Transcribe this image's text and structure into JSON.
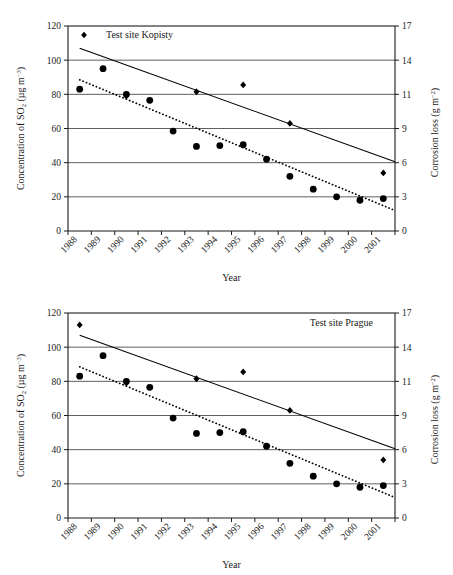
{
  "figures": [
    {
      "id": "kopisty",
      "label": "Test site Kopisty",
      "label_position": "top-left",
      "label_marker": "diamond",
      "chart_data": {
        "type": "scatter",
        "title": "Test site Kopisty",
        "xlabel": "Year",
        "ylabel": "Concentration of SO2 (µg m-3)",
        "y2label": "Corrosion loss (g m-2)",
        "categories": [
          "1988",
          "1989",
          "1990",
          "1991",
          "1992",
          "1993",
          "1994",
          "1995",
          "1996",
          "1997",
          "1998",
          "1999",
          "2000",
          "2001"
        ],
        "ylim": [
          0,
          120
        ],
        "yticks": [
          0,
          20,
          40,
          60,
          80,
          100,
          120
        ],
        "y2lim": [
          0,
          17
        ],
        "y2ticks": [
          0,
          3,
          6,
          9,
          11,
          14,
          17
        ],
        "grid": "horizontal",
        "legend": "inside-top-left",
        "series": [
          {
            "name": "Concentration of SO2",
            "marker": "circle",
            "axis": "left",
            "values": [
              83,
              95,
              80,
              76.5,
              58.5,
              49.5,
              50,
              50.5,
              42,
              32,
              24.5,
              20,
              18,
              19
            ]
          },
          {
            "name": "Corrosion loss",
            "marker": "diamond",
            "axis": "left",
            "values": [
              null,
              null,
              79,
              null,
              null,
              81.5,
              null,
              85.5,
              null,
              63,
              null,
              null,
              null,
              34
            ]
          }
        ],
        "trendlines": [
          {
            "name": "Corrosion loss trend",
            "style": "solid",
            "x_start": "1988",
            "x_end": "2001",
            "y_start": 107,
            "y_end": 40.5
          },
          {
            "name": "SO2 concentration trend",
            "style": "dotted",
            "x_start": "1988",
            "x_end": "2001",
            "y_start": 88.5,
            "y_end": 12
          }
        ]
      }
    },
    {
      "id": "prague",
      "label": "Test site Prague",
      "label_position": "top-right",
      "label_marker": "none",
      "chart_data": {
        "type": "scatter",
        "title": "Test site Prague",
        "xlabel": "Year",
        "ylabel": "Concentration of SO2 (µg m-3)",
        "y2label": "Corrosion loss (g m-2)",
        "categories": [
          "1988",
          "1989",
          "1990",
          "1991",
          "1992",
          "1993",
          "1994",
          "1995",
          "1996",
          "1997",
          "1998",
          "1999",
          "2000",
          "2001"
        ],
        "ylim": [
          0,
          120
        ],
        "yticks": [
          0,
          20,
          40,
          60,
          80,
          100,
          120
        ],
        "y2lim": [
          0,
          17
        ],
        "y2ticks": [
          0,
          3,
          6,
          9,
          11,
          14,
          17
        ],
        "grid": "horizontal",
        "legend": "inside-top-right",
        "series": [
          {
            "name": "Concentration of SO2",
            "marker": "circle",
            "axis": "left",
            "values": [
              83,
              95,
              80,
              76.5,
              58.5,
              49.5,
              50,
              50.5,
              42,
              32,
              24.5,
              20,
              18,
              19
            ]
          },
          {
            "name": "Corrosion loss",
            "marker": "diamond",
            "axis": "left",
            "values": [
              113,
              null,
              79,
              null,
              null,
              81.5,
              null,
              85.5,
              null,
              63,
              null,
              null,
              null,
              34
            ]
          }
        ],
        "trendlines": [
          {
            "name": "Corrosion loss trend",
            "style": "solid",
            "x_start": "1988",
            "x_end": "2001",
            "y_start": 107,
            "y_end": 40.5
          },
          {
            "name": "SO2 concentration trend",
            "style": "dotted",
            "x_start": "1988",
            "x_end": "2001",
            "y_start": 88.5,
            "y_end": 12
          }
        ]
      }
    }
  ],
  "axis_text": {
    "y_title_main": "Concentration of SO",
    "y_title_sub": "2",
    "y_title_unit_open": " (µg m",
    "y_title_unit_sup": "−3",
    "y_title_unit_close": ")",
    "y2_title_main": "Corrosion loss (g m",
    "y2_title_sup": "−2",
    "y2_title_close": ")",
    "x_title": "Year"
  }
}
